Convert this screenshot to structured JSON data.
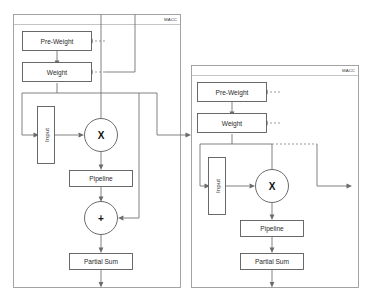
{
  "figure": {
    "type": "block-diagram",
    "background_color": "#ffffff",
    "line_color": "#6b6b6b",
    "box_stroke_color": "#5a5a5a",
    "panel_stroke_color": "#9a9a9a",
    "text_color": "#2b2b2b"
  },
  "panels": [
    {
      "id": "macc-left",
      "title": "MACC",
      "nodes": {
        "pre_weight": "Pre-Weight",
        "weight": "Weight",
        "input": "Input",
        "multiplier": "X",
        "pipeline": "Pipeline",
        "adder": "+",
        "partial_sum": "Partial Sum"
      }
    },
    {
      "id": "macc-right",
      "title": "MACC",
      "nodes": {
        "pre_weight": "Pre-Weight",
        "weight": "Weight",
        "input": "Input",
        "multiplier": "X",
        "pipeline": "Pipeline",
        "partial_sum": "Partial Sum"
      }
    }
  ]
}
